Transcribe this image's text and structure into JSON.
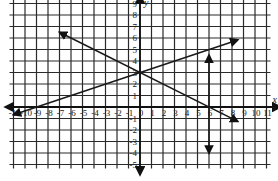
{
  "chart_data": {
    "type": "line",
    "title": "",
    "xlabel": "x",
    "ylabel": "y",
    "xlim": [
      -11,
      11
    ],
    "ylim": [
      -5,
      9
    ],
    "grid": true,
    "legend": null,
    "x_ticks": [
      -11,
      -10,
      -9,
      -8,
      -7,
      -6,
      -5,
      -4,
      -3,
      -2,
      -1,
      0,
      1,
      2,
      3,
      4,
      5,
      6,
      7,
      8,
      9,
      10,
      11
    ],
    "x_tick_labels": [
      "-11",
      "-10",
      "-9",
      "-8",
      "-7",
      "-6",
      "-5",
      "-4",
      "-3",
      "-2",
      "-1",
      "0",
      "1",
      "2",
      "3",
      "4",
      "5",
      "6",
      "7",
      "8",
      "9",
      "10",
      "11"
    ],
    "y_ticks": [
      -5,
      -4,
      -3,
      -2,
      -1,
      1,
      2,
      3,
      4,
      5,
      6,
      7,
      8,
      9
    ],
    "y_tick_labels": [
      "-5",
      "-4",
      "-3",
      "-2",
      "-1",
      "1",
      "2",
      "3",
      "4",
      "5",
      "6",
      "7",
      "8",
      "9"
    ],
    "series": [
      {
        "name": "line-increasing",
        "equation": "y = x/3 + 3",
        "x": [
          -11,
          8.5
        ],
        "y": [
          -0.67,
          5.83
        ],
        "arrows": "both"
      },
      {
        "name": "line-decreasing",
        "equation": "y = -x/2 + 3",
        "x": [
          -7,
          8.5
        ],
        "y": [
          6.5,
          -1.25
        ],
        "arrows": "both"
      },
      {
        "name": "vertical-segment",
        "equation": "x = 6",
        "x": [
          6,
          6
        ],
        "y": [
          -4,
          4.5
        ],
        "arrows": "both"
      }
    ],
    "annotations": [
      "Lines intersect at (0, 3)"
    ]
  },
  "labels": {
    "x_axis": "x",
    "y_axis": "y"
  },
  "colors": {
    "grid": "#2a2a2a",
    "axis": "#111111",
    "line": "#1a1a1a",
    "background": "#ffffff"
  }
}
